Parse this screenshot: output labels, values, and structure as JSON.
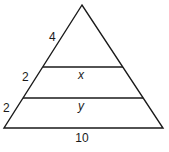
{
  "diagram": {
    "type": "triangle-with-parallel-segments",
    "side_labels": {
      "top_segment": "4",
      "middle_segment": "2",
      "bottom_segment": "2"
    },
    "parallel_segments": {
      "upper": "x",
      "lower": "y"
    },
    "base_label": "10"
  }
}
